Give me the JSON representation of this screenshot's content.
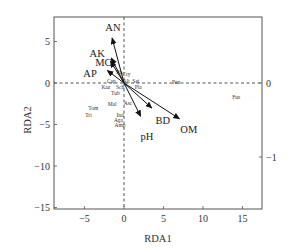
{
  "chart_data": {
    "type": "scatter",
    "subtype": "rda-biplot",
    "title": "",
    "xlabel": "RDA1",
    "ylabel": "RDA2",
    "xlim": [
      -8.7,
      17.5
    ],
    "ylim": [
      -15.3,
      7.8
    ],
    "x_ticks": [
      -5,
      0,
      5,
      10,
      15
    ],
    "y_ticks": [
      5,
      0,
      -5,
      -10,
      -15
    ],
    "right_axis": {
      "ticks": [
        0,
        -1
      ],
      "label": ""
    },
    "grid": false,
    "reference_lines": {
      "x0_dashed": true,
      "y0_dashed": true
    },
    "env_vectors": [
      {
        "name": "AN",
        "x": -1.5,
        "y": 5.4,
        "label_x": -1.4,
        "label_y": 6.7
      },
      {
        "name": "AK",
        "x": -1.6,
        "y": 3.0,
        "label_x": -3.4,
        "label_y": 3.6
      },
      {
        "name": "MC",
        "x": -1.7,
        "y": 2.6,
        "label_x": -2.6,
        "label_y": 2.5
      },
      {
        "name": "AP",
        "x": -2.1,
        "y": 1.5,
        "label_x": -4.3,
        "label_y": 1.2
      },
      {
        "name": "pH",
        "x": 2.1,
        "y": -4.0,
        "label_x": 2.9,
        "label_y": -6.4
      },
      {
        "name": "BD",
        "x": 3.5,
        "y": -3.0,
        "label_x": 4.9,
        "label_y": -4.4
      },
      {
        "name": "OM",
        "x": 7.0,
        "y": -4.3,
        "label_x": 8.2,
        "label_y": -5.6
      }
    ],
    "species": [
      {
        "name": "Pu",
        "x": -0.6,
        "y": 1.3
      },
      {
        "name": "Cry",
        "x": 0.3,
        "y": 1.1
      },
      {
        "name": "Cap",
        "x": -1.6,
        "y": 0.3
      },
      {
        "name": "Alt",
        "x": 0.3,
        "y": 0.3
      },
      {
        "name": "Sei",
        "x": 1.5,
        "y": 0.3
      },
      {
        "name": "Kaz",
        "x": -2.3,
        "y": -0.5
      },
      {
        "name": "Sch",
        "x": -0.5,
        "y": -0.5
      },
      {
        "name": "Pla",
        "x": 1.8,
        "y": -0.5
      },
      {
        "name": "Tub",
        "x": -1.1,
        "y": -1.2
      },
      {
        "name": "Pen",
        "x": 6.6,
        "y": 0.1
      },
      {
        "name": "Fus",
        "x": 14.2,
        "y": -1.7
      },
      {
        "name": "Mal",
        "x": -1.5,
        "y": -2.5
      },
      {
        "name": "Asc",
        "x": 0.5,
        "y": -2.4
      },
      {
        "name": "Tom",
        "x": -3.9,
        "y": -3.0
      },
      {
        "name": "Tri",
        "x": -4.5,
        "y": -3.8
      },
      {
        "name": "Ind",
        "x": -0.5,
        "y": -3.8
      },
      {
        "name": "Aga",
        "x": -0.7,
        "y": -4.5
      },
      {
        "name": "Amp",
        "x": -0.5,
        "y": -5.1
      }
    ]
  },
  "axes": {
    "x_title": "RDA1",
    "y_title": "RDA2",
    "x_tick_labels": [
      "−5",
      "0",
      "5",
      "10",
      "15"
    ],
    "y_tick_labels": [
      "5",
      "0",
      "−5",
      "−10",
      "−15"
    ],
    "right_tick_labels": [
      "0",
      "−1"
    ]
  }
}
